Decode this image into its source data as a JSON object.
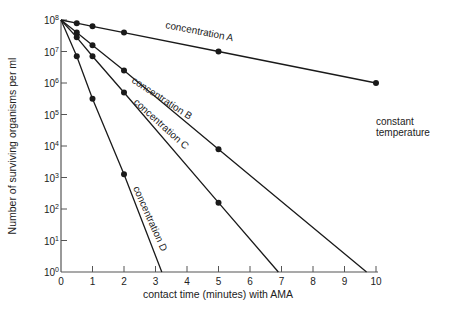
{
  "chart_data": {
    "type": "line",
    "title": "",
    "xlabel": "contact time (minutes) with AMA",
    "ylabel": "Number of surviving organisms per ml",
    "yscale": "log10",
    "xlim": [
      0,
      10
    ],
    "ylim_exponent": [
      0,
      8
    ],
    "x_ticks": [
      "0",
      "1",
      "2",
      "3",
      "4",
      "5",
      "6",
      "7",
      "8",
      "9",
      "10"
    ],
    "y_ticks": [
      {
        "base": "10",
        "exp": "0"
      },
      {
        "base": "10",
        "exp": "1"
      },
      {
        "base": "10",
        "exp": "2"
      },
      {
        "base": "10",
        "exp": "3"
      },
      {
        "base": "10",
        "exp": "4"
      },
      {
        "base": "10",
        "exp": "5"
      },
      {
        "base": "10",
        "exp": "6"
      },
      {
        "base": "10",
        "exp": "7"
      },
      {
        "base": "10",
        "exp": "8"
      }
    ],
    "grid": false,
    "legend": "none (inline curve labels)",
    "annotation": [
      "constant",
      "temperature"
    ],
    "series": [
      {
        "name": "concentration A",
        "points_log10": [
          [
            0,
            8.0
          ],
          [
            0.5,
            7.9
          ],
          [
            1,
            7.8
          ],
          [
            2,
            7.6
          ],
          [
            5,
            7.0
          ],
          [
            10,
            6.0
          ]
        ],
        "line_end": [
          10,
          6.0
        ],
        "label_pos": [
          165,
          28
        ],
        "label_angle": 11
      },
      {
        "name": "concentration B",
        "points_log10": [
          [
            0,
            8.0
          ],
          [
            0.5,
            7.6
          ],
          [
            1,
            7.2
          ],
          [
            2,
            6.4
          ],
          [
            5,
            3.9
          ]
        ],
        "line_end": [
          9.7,
          0
        ],
        "label_pos": [
          131,
          82
        ],
        "label_angle": 33
      },
      {
        "name": "concentration C",
        "points_log10": [
          [
            0,
            8.0
          ],
          [
            0.5,
            7.45
          ],
          [
            1,
            6.85
          ],
          [
            2,
            5.7
          ],
          [
            5,
            2.2
          ]
        ],
        "line_end": [
          6.9,
          0
        ],
        "label_pos": [
          133,
          103
        ],
        "label_angle": 42
      },
      {
        "name": "concentration D",
        "points_log10": [
          [
            0,
            8.0
          ],
          [
            0.5,
            6.85
          ],
          [
            1,
            5.5
          ],
          [
            2,
            3.1
          ]
        ],
        "line_end": [
          3.2,
          0
        ],
        "label_pos": [
          133,
          188
        ],
        "label_angle": 66
      }
    ]
  },
  "colors": {
    "line": "#1a1a1a",
    "axis": "#555555",
    "background": "#ffffff"
  }
}
